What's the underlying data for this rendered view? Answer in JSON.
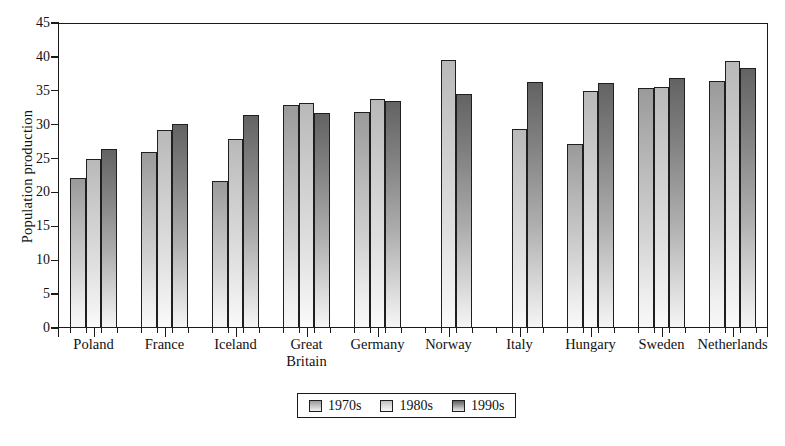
{
  "chart_data": {
    "type": "bar",
    "title": "",
    "xlabel": "",
    "ylabel": "Population production",
    "ylim": [
      0,
      45
    ],
    "ytick_step": 5,
    "yticks": [
      0,
      5,
      10,
      15,
      20,
      25,
      30,
      35,
      40,
      45
    ],
    "grid": false,
    "legend_position": "bottom",
    "categories": [
      "Poland",
      "France",
      "Iceland",
      "Great\nBritain",
      "Germany",
      "Norway",
      "Italy",
      "Hungary",
      "Sweden",
      "Netherlands"
    ],
    "series": [
      {
        "name": "1970s",
        "values": [
          22.1,
          25.9,
          21.7,
          32.9,
          31.8,
          null,
          null,
          27.2,
          35.4,
          36.4
        ]
      },
      {
        "name": "1980s",
        "values": [
          24.9,
          29.2,
          27.9,
          33.2,
          33.8,
          39.6,
          29.3,
          35.0,
          35.6,
          39.4
        ]
      },
      {
        "name": "1990s",
        "values": [
          26.4,
          30.1,
          31.4,
          31.7,
          33.5,
          34.6,
          36.3,
          36.2,
          36.9,
          38.3
        ]
      }
    ],
    "series_colors": [
      "#9a9a9a",
      "#bdbdbd",
      "#5f5f5f"
    ]
  },
  "legend": {
    "items": [
      {
        "label": "1970s"
      },
      {
        "label": "1980s"
      },
      {
        "label": "1990s"
      }
    ]
  },
  "axis": {
    "y_title": "Population production"
  }
}
